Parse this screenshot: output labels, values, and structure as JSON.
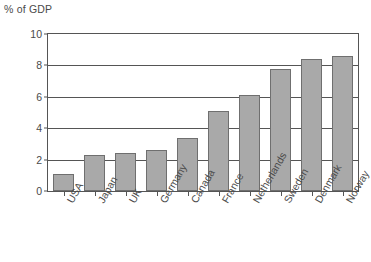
{
  "chart_data": {
    "type": "bar",
    "title": "",
    "subtitle": "",
    "xlabel": "",
    "ylabel": "% of GDP",
    "ylim": [
      0,
      10
    ],
    "yticks": [
      0,
      2,
      4,
      6,
      8,
      10
    ],
    "grid": true,
    "legend": "none",
    "categories": [
      "USA",
      "Japan",
      "UK",
      "Germany",
      "Canada",
      "France",
      "Netherlands",
      "Sweden",
      "Denmark",
      "Norway"
    ],
    "values": [
      1.1,
      2.3,
      2.4,
      2.6,
      3.4,
      5.1,
      6.1,
      7.8,
      8.4,
      8.6
    ],
    "colors": {
      "bar_fill": "#a9a9a9",
      "bar_border": "#6f6f6f",
      "axis": "#555555",
      "text": "#4a4a4a",
      "background": "#ffffff"
    }
  }
}
